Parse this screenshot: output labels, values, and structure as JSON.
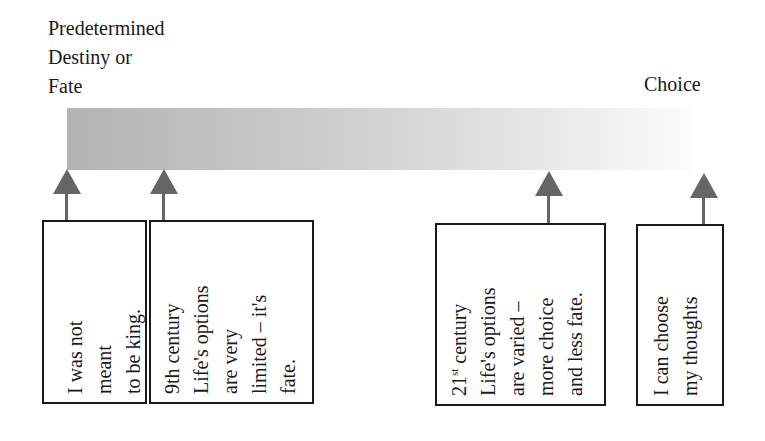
{
  "diagram": {
    "left_label": [
      "Predetermined",
      "Destiny or",
      "Fate"
    ],
    "right_label": "Choice",
    "bar": {
      "gradient_start": "#b3b3b3",
      "gradient_end": "#fbfbfb"
    },
    "arrow_color": "#656565",
    "boxes": [
      {
        "lines": [
          "I was not",
          "meant",
          "to be king."
        ]
      },
      {
        "lines": [
          "9th century",
          "Life's options",
          "are very",
          "limited – it's",
          "fate."
        ]
      },
      {
        "lines_prefix": "21",
        "lines_sup": "st",
        "first_line_rest": " century",
        "lines": [
          "21st century",
          "Life's options",
          "are varied –",
          "more choice",
          "and less fate."
        ]
      },
      {
        "lines": [
          "I can choose",
          "my thoughts"
        ]
      }
    ]
  }
}
